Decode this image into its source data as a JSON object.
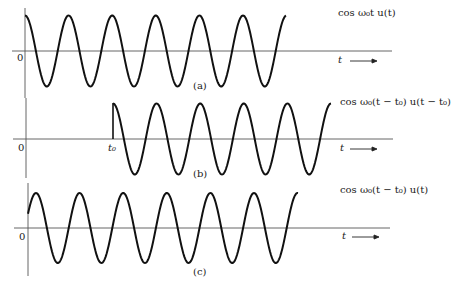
{
  "figure": {
    "panels": [
      {
        "id": "a",
        "tag": "(a)",
        "equation": "cos ω₀t u(t)",
        "origin_label": "0",
        "axis_label": "t ⟶",
        "signal": "cos(w0*t) for t>=0, zero before",
        "start_marker": null
      },
      {
        "id": "b",
        "tag": "(b)",
        "equation": "cos ω₀(t − t₀) u(t − t₀)",
        "origin_label": "0",
        "axis_label": "t ⟶",
        "start_marker": "t₀",
        "signal": "cos(w0*(t-t0)) for t>=t0, zero before"
      },
      {
        "id": "c",
        "tag": "(c)",
        "equation": "cos ω₀(t − t₀) u(t)",
        "origin_label": "0",
        "axis_label": "t ⟶",
        "start_marker": null,
        "signal": "cos(w0*(t-t0)) for t>=0, zero before"
      }
    ],
    "colors": {
      "curve": "#111111",
      "axis": "#555555",
      "background": "#ffffff"
    }
  },
  "chart_data": [
    {
      "type": "line",
      "title": "cos ω₀t u(t)",
      "xlabel": "t",
      "ylabel": "",
      "x_start": 0,
      "periods_shown": 6,
      "amplitude": 1,
      "phase_shift": 0
    },
    {
      "type": "line",
      "title": "cos ω₀(t − t₀) u(t − t₀)",
      "xlabel": "t",
      "ylabel": "",
      "x_start": "t₀",
      "periods_shown": 5,
      "amplitude": 1,
      "phase_shift": "t₀"
    },
    {
      "type": "line",
      "title": "cos ω₀(t − t₀) u(t)",
      "xlabel": "t",
      "ylabel": "",
      "x_start": 0,
      "periods_shown": 6.5,
      "amplitude": 1,
      "phase_shift": "t₀"
    }
  ]
}
